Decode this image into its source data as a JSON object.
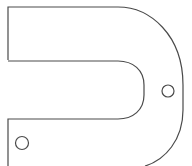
{
  "diagram": {
    "title": "",
    "shape": "u-shaped bracket outline",
    "features": [
      {
        "name": "bracket-outline",
        "type": "path"
      },
      {
        "name": "mounting-hole-right",
        "type": "circle"
      },
      {
        "name": "mounting-hole-left",
        "type": "circle"
      }
    ],
    "colors": {
      "stroke": "#4a4a4a",
      "background": "#ffffff"
    }
  }
}
